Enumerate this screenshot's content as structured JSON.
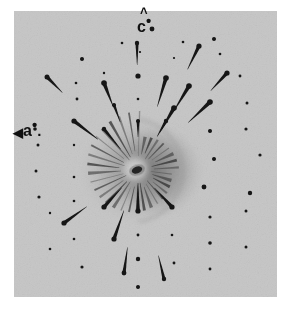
{
  "figure": {
    "type": "x-ray-diffraction-photograph",
    "plate": {
      "background_color": "#c8c8c8",
      "page_background": "#ffffff",
      "left": 14,
      "top": 11,
      "width": 263,
      "height": 286
    },
    "beam_center": {
      "x": 124,
      "y": 159
    },
    "spot_color": "#141414",
    "halo_color": "#9a9a9a"
  },
  "labels": {
    "c_star": {
      "text": "c",
      "hat": "˄",
      "star": "•",
      "name": "c-star-reciprocal-axis"
    },
    "a_star": {
      "arrow": "◀",
      "text": "a",
      "star": "•",
      "dot": ".",
      "name": "a-star-reciprocal-axis"
    }
  },
  "chart_data": {
    "type": "scatter",
    "title": "",
    "xlabel": "",
    "ylabel": "",
    "grid": false,
    "legend": null,
    "annotations": [
      {
        "label": "c*",
        "x": 148,
        "y": 22,
        "meaning": "reciprocal c-axis direction (up)"
      },
      {
        "label": "a*",
        "x": 30,
        "y": 126,
        "meaning": "reciprocal a-axis direction (left, slightly up)"
      }
    ],
    "center": {
      "x": 124,
      "y": 159
    },
    "note": "Reflections listed as plate-local coordinates (x,y in px from plate origin), r = radius from beam center, size = spot radius, tail = streak length toward center",
    "reflections": [
      {
        "x": 138,
        "y": 18,
        "size": 2.4,
        "tail": 0
      },
      {
        "x": 108,
        "y": 32,
        "size": 1.3,
        "tail": 0
      },
      {
        "x": 169,
        "y": 31,
        "size": 1.3,
        "tail": 0
      },
      {
        "x": 200,
        "y": 28,
        "size": 2.0,
        "tail": 0
      },
      {
        "x": 68,
        "y": 48,
        "size": 2.0,
        "tail": 0
      },
      {
        "x": 126,
        "y": 41,
        "size": 1.1,
        "tail": 0
      },
      {
        "x": 160,
        "y": 47,
        "size": 1.1,
        "tail": 0
      },
      {
        "x": 206,
        "y": 43,
        "size": 1.3,
        "tail": 0
      },
      {
        "x": 123,
        "y": 32,
        "size": 2.2,
        "tail": 22
      },
      {
        "x": 185,
        "y": 35,
        "size": 2.6,
        "tail": 26
      },
      {
        "x": 124,
        "y": 65,
        "size": 2.6,
        "tail": 0
      },
      {
        "x": 90,
        "y": 62,
        "size": 1.2,
        "tail": 0
      },
      {
        "x": 62,
        "y": 72,
        "size": 1.3,
        "tail": 0
      },
      {
        "x": 226,
        "y": 65,
        "size": 1.4,
        "tail": 0
      },
      {
        "x": 33,
        "y": 66,
        "size": 2.5,
        "tail": 22
      },
      {
        "x": 90,
        "y": 72,
        "size": 2.8,
        "tail": 26
      },
      {
        "x": 152,
        "y": 67,
        "size": 2.8,
        "tail": 30
      },
      {
        "x": 213,
        "y": 62,
        "size": 2.6,
        "tail": 24
      },
      {
        "x": 124,
        "y": 88,
        "size": 1.3,
        "tail": 0
      },
      {
        "x": 175,
        "y": 75,
        "size": 2.8,
        "tail": 30
      },
      {
        "x": 63,
        "y": 88,
        "size": 1.4,
        "tail": 0
      },
      {
        "x": 100,
        "y": 94,
        "size": 2.0,
        "tail": 18
      },
      {
        "x": 233,
        "y": 92,
        "size": 1.5,
        "tail": 0
      },
      {
        "x": 60,
        "y": 110,
        "size": 2.6,
        "tail": 30
      },
      {
        "x": 160,
        "y": 97,
        "size": 2.8,
        "tail": 28
      },
      {
        "x": 196,
        "y": 91,
        "size": 2.8,
        "tail": 30
      },
      {
        "x": 21,
        "y": 118,
        "size": 1.8,
        "tail": 0
      },
      {
        "x": 90,
        "y": 118,
        "size": 2.2,
        "tail": 26
      },
      {
        "x": 124,
        "y": 110,
        "size": 2.0,
        "tail": 16
      },
      {
        "x": 152,
        "y": 110,
        "size": 2.2,
        "tail": 18
      },
      {
        "x": 196,
        "y": 120,
        "size": 2.0,
        "tail": 0
      },
      {
        "x": 232,
        "y": 118,
        "size": 1.6,
        "tail": 0
      },
      {
        "x": 24,
        "y": 134,
        "size": 1.5,
        "tail": 0
      },
      {
        "x": 60,
        "y": 134,
        "size": 1.2,
        "tail": 0
      },
      {
        "x": 200,
        "y": 148,
        "size": 2.0,
        "tail": 0
      },
      {
        "x": 246,
        "y": 144,
        "size": 1.6,
        "tail": 0
      },
      {
        "x": 22,
        "y": 160,
        "size": 1.5,
        "tail": 0
      },
      {
        "x": 60,
        "y": 166,
        "size": 1.3,
        "tail": 0
      },
      {
        "x": 190,
        "y": 176,
        "size": 2.4,
        "tail": 0
      },
      {
        "x": 236,
        "y": 182,
        "size": 2.2,
        "tail": 0
      },
      {
        "x": 25,
        "y": 186,
        "size": 1.6,
        "tail": 0
      },
      {
        "x": 60,
        "y": 190,
        "size": 1.3,
        "tail": 0
      },
      {
        "x": 90,
        "y": 196,
        "size": 2.6,
        "tail": 26
      },
      {
        "x": 124,
        "y": 200,
        "size": 2.6,
        "tail": 28
      },
      {
        "x": 158,
        "y": 196,
        "size": 2.6,
        "tail": 26
      },
      {
        "x": 196,
        "y": 206,
        "size": 1.6,
        "tail": 0
      },
      {
        "x": 232,
        "y": 200,
        "size": 1.5,
        "tail": 0
      },
      {
        "x": 50,
        "y": 212,
        "size": 2.6,
        "tail": 28
      },
      {
        "x": 124,
        "y": 224,
        "size": 1.4,
        "tail": 0
      },
      {
        "x": 158,
        "y": 224,
        "size": 1.3,
        "tail": 0
      },
      {
        "x": 60,
        "y": 228,
        "size": 1.3,
        "tail": 0
      },
      {
        "x": 100,
        "y": 228,
        "size": 2.6,
        "tail": 30
      },
      {
        "x": 196,
        "y": 232,
        "size": 1.8,
        "tail": 0
      },
      {
        "x": 232,
        "y": 236,
        "size": 1.5,
        "tail": 0
      },
      {
        "x": 124,
        "y": 248,
        "size": 2.2,
        "tail": 0
      },
      {
        "x": 68,
        "y": 256,
        "size": 1.6,
        "tail": 0
      },
      {
        "x": 160,
        "y": 252,
        "size": 1.4,
        "tail": 0
      },
      {
        "x": 196,
        "y": 258,
        "size": 1.4,
        "tail": 0
      },
      {
        "x": 110,
        "y": 262,
        "size": 2.4,
        "tail": 26
      },
      {
        "x": 150,
        "y": 268,
        "size": 2.2,
        "tail": 24
      },
      {
        "x": 124,
        "y": 276,
        "size": 2.0,
        "tail": 0
      },
      {
        "x": 36,
        "y": 238,
        "size": 1.3,
        "tail": 0
      },
      {
        "x": 36,
        "y": 202,
        "size": 1.2,
        "tail": 0
      }
    ]
  }
}
